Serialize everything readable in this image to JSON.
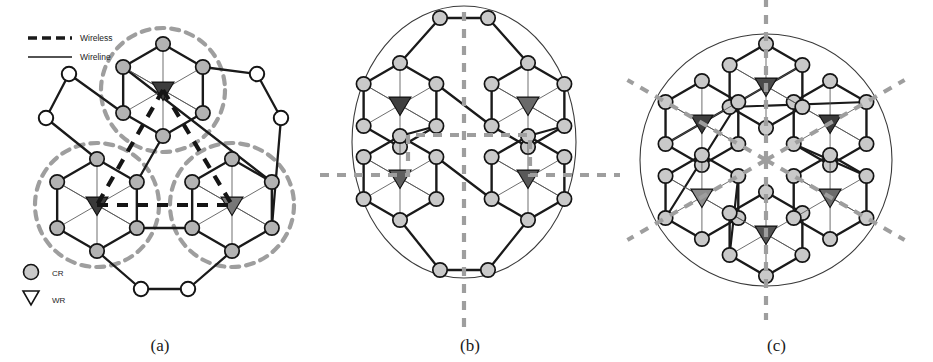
{
  "figure": {
    "type": "network-topology-diagram",
    "background": "#ffffff",
    "panels": [
      {
        "id": "a",
        "caption": "(a)"
      },
      {
        "id": "b",
        "caption": "(b)"
      },
      {
        "id": "c",
        "caption": "(c)"
      }
    ]
  },
  "legend": {
    "line_styles": [
      {
        "key": "wireless",
        "label": "Wireless",
        "style": "dashed",
        "color": "#1a1a1a",
        "width": 3.2
      },
      {
        "key": "wireline",
        "label": "Wireline",
        "style": "solid",
        "color": "#1a1a1a",
        "width": 1.3
      }
    ],
    "node_types": [
      {
        "key": "cr",
        "label": "CR",
        "shape": "circle",
        "icon": "circle-icon",
        "fill": "#b8b8b8",
        "stroke": "#1a1a1a"
      },
      {
        "key": "wr",
        "label": "WR",
        "shape": "triangle-down",
        "icon": "triangle-down-icon",
        "fill": "#4a4a4a",
        "stroke": "#1a1a1a"
      }
    ]
  },
  "colors": {
    "node_cr_fill": "#b3b3b3",
    "node_cr_fill_light": "#c9c9c9",
    "node_cr_empty_fill": "#ffffff",
    "node_stroke": "#141414",
    "node_wr_fill_dark": "#3d3d3d",
    "node_wr_fill_mid": "#6e6e6e",
    "node_wr_fill_light": "#8d8d8d",
    "edge_wireline": "#1a1a1a",
    "edge_spoke": "#555555",
    "edge_arc": "#3a3a3a",
    "cluster_circle": "#9e9e9e",
    "partition_line": "#9e9e9e",
    "wireless_link": "#151515"
  },
  "panel_a": {
    "caption": "(a)",
    "description": "Three clustered hexagon cells each enclosed by a dashed cluster boundary, joined by thick dashed wireless links; outer ring of empty wireline-only nodes.",
    "cluster_boundaries": [
      {
        "cx": 163,
        "cy": 90,
        "r": 62
      },
      {
        "cx": 97,
        "cy": 205,
        "r": 62
      },
      {
        "cx": 232,
        "cy": 205,
        "r": 62
      }
    ],
    "hex_clusters": [
      {
        "cx": 163,
        "cy": 90,
        "wr_fill": "#3d3d3d"
      },
      {
        "cx": 97,
        "cy": 205,
        "wr_fill": "#3a3a3a"
      },
      {
        "cx": 232,
        "cy": 205,
        "wr_fill": "#777777"
      }
    ],
    "hex_radius": 46,
    "wireless_links": [
      {
        "from": [
          163,
          90
        ],
        "to": [
          97,
          205
        ]
      },
      {
        "from": [
          163,
          90
        ],
        "to": [
          232,
          205
        ]
      },
      {
        "from": [
          97,
          205
        ],
        "to": [
          232,
          205
        ]
      }
    ],
    "outer_nodes": [
      {
        "x": 69,
        "y": 74
      },
      {
        "x": 46,
        "y": 118
      },
      {
        "x": 257,
        "y": 74
      },
      {
        "x": 281,
        "y": 118
      },
      {
        "x": 141,
        "y": 289
      },
      {
        "x": 188,
        "y": 289
      }
    ]
  },
  "panel_b": {
    "caption": "(b)",
    "description": "Four hexagon cells in a two-by-two arrangement inside an elliptical outline, divided by grey dashed partition lines forming a cross.",
    "hex_clusters": [
      {
        "cx": 80,
        "cy": 105,
        "wr_fill": "#3f3f3f"
      },
      {
        "cx": 208,
        "cy": 105,
        "wr_fill": "#6a6a6a"
      },
      {
        "cx": 80,
        "cy": 178,
        "wr_fill": "#5f5f5f"
      },
      {
        "cx": 208,
        "cy": 178,
        "wr_fill": "#595959"
      }
    ],
    "hex_radius": 42,
    "partition_lines": [
      {
        "type": "vertical",
        "x": 144,
        "y1": 12,
        "y2": 330
      },
      {
        "type": "horizontal",
        "y": 175,
        "x1": 0,
        "x2": 300
      }
    ],
    "center": [
      144,
      142
    ]
  },
  "panel_c": {
    "caption": "(c)",
    "description": "Six hexagon cells arranged radially, divided into six sectors by grey dashed lines radiating from the centre.",
    "hex_clusters": [
      {
        "cx": 86,
        "cy": 86,
        "wr_fill": "#3b3b3b"
      },
      {
        "cx": 196,
        "cy": 86,
        "wr_fill": "#4a4a4a"
      },
      {
        "cx": 62,
        "cy": 165,
        "wr_fill": "#3f3f3f"
      },
      {
        "cx": 222,
        "cy": 150,
        "wr_fill": "#8d8d8d"
      },
      {
        "cx": 110,
        "cy": 238,
        "wr_fill": "#555555"
      },
      {
        "cx": 198,
        "cy": 232,
        "wr_fill": "#6b6b6b"
      }
    ],
    "hex_radius": 42,
    "partition_rays": [
      {
        "angle_deg": 90,
        "label": "up"
      },
      {
        "angle_deg": 270,
        "label": "down"
      },
      {
        "angle_deg": 30,
        "label": "upper-right"
      },
      {
        "angle_deg": 210,
        "label": "lower-left"
      },
      {
        "angle_deg": 150,
        "label": "upper-left"
      },
      {
        "angle_deg": 330,
        "label": "lower-right"
      }
    ],
    "center": [
      146,
      160
    ]
  }
}
